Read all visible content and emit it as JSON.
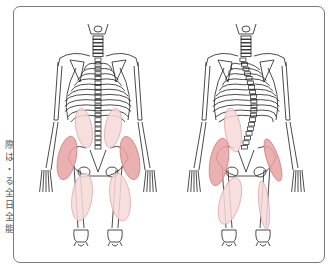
{
  "side_caption": "際は・る全日全能",
  "figure": {
    "panels": [
      {
        "name": "left",
        "center_x": 98,
        "muscles": [
          {
            "name": "upper-back-left",
            "cx": 84,
            "cy": 128,
            "rx": 8,
            "ry": 20,
            "rot": -10,
            "shade": "light"
          },
          {
            "name": "upper-back-right",
            "cx": 113,
            "cy": 128,
            "rx": 8,
            "ry": 20,
            "rot": 10,
            "shade": "light"
          },
          {
            "name": "hip-outer-left",
            "cx": 67,
            "cy": 158,
            "rx": 9,
            "ry": 22,
            "rot": 12,
            "shade": "dark"
          },
          {
            "name": "hip-outer-right",
            "cx": 130,
            "cy": 158,
            "rx": 9,
            "ry": 22,
            "rot": -12,
            "shade": "dark"
          },
          {
            "name": "thigh-left",
            "cx": 82,
            "cy": 197,
            "rx": 10,
            "ry": 24,
            "rot": 8,
            "shade": "light"
          },
          {
            "name": "thigh-right",
            "cx": 120,
            "cy": 197,
            "rx": 10,
            "ry": 24,
            "rot": -8,
            "shade": "light"
          }
        ]
      },
      {
        "name": "right",
        "center_x": 246,
        "muscles": [
          {
            "name": "upper-back-left",
            "cx": 233,
            "cy": 130,
            "rx": 8,
            "ry": 22,
            "rot": -8,
            "shade": "light"
          },
          {
            "name": "hip-outer-left",
            "cx": 219,
            "cy": 162,
            "rx": 9,
            "ry": 24,
            "rot": 10,
            "shade": "dark"
          },
          {
            "name": "hip-outer-right",
            "cx": 273,
            "cy": 160,
            "rx": 6,
            "ry": 22,
            "rot": -18,
            "shade": "dark"
          },
          {
            "name": "thigh-left",
            "cx": 230,
            "cy": 201,
            "rx": 10,
            "ry": 24,
            "rot": 16,
            "shade": "light"
          },
          {
            "name": "thigh-right",
            "cx": 264,
            "cy": 205,
            "rx": 5,
            "ry": 24,
            "rot": -6,
            "shade": "light"
          }
        ]
      }
    ],
    "colors": {
      "dark_fill": "#e8a2a2",
      "dark_stroke": "#d27f7f",
      "light_fill": "#f7d9d9",
      "light_stroke": "#e3a9a9",
      "bone_stroke": "#1e1e1e",
      "frame": "#7a7a7a"
    }
  }
}
